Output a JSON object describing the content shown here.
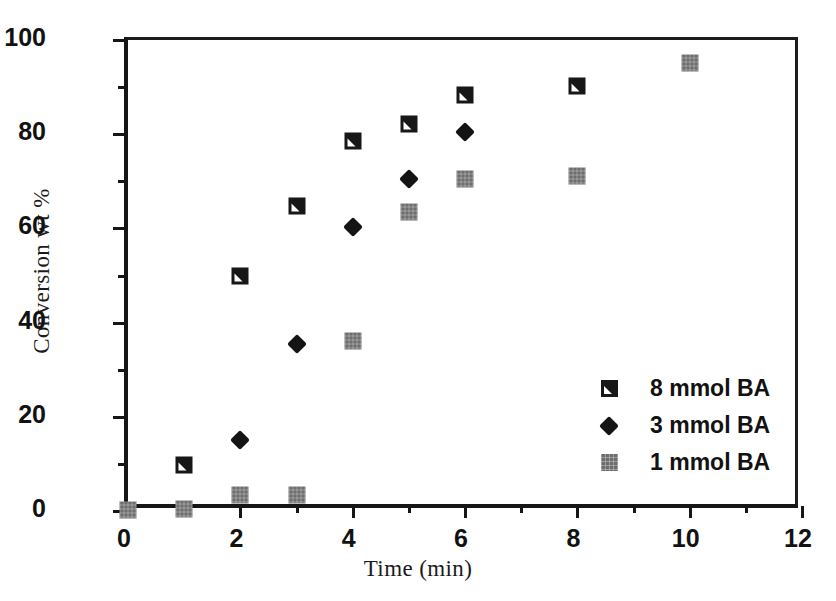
{
  "chart_data": {
    "type": "scatter",
    "title": "",
    "xlabel": "Time (min)",
    "ylabel": "Conversion wt %",
    "xlim": [
      0,
      12
    ],
    "ylim": [
      0,
      100
    ],
    "xticks": [
      0,
      2,
      4,
      6,
      8,
      10,
      12
    ],
    "xtick_labels": [
      "0",
      "2",
      "4",
      "6",
      "8",
      "10",
      "12"
    ],
    "xminor_ticks": [
      1,
      3,
      5,
      7,
      9,
      11
    ],
    "yticks": [
      0,
      20,
      40,
      60,
      80,
      100
    ],
    "ytick_labels": [
      "0",
      "20",
      "40",
      "60",
      "80",
      "100"
    ],
    "yminor_ticks": [
      10,
      30,
      50,
      70,
      90
    ],
    "grid": false,
    "legend_position": "center-right",
    "series": [
      {
        "name": "8 mmol BA",
        "marker": "square-notched",
        "color": "#171717",
        "x": [
          1,
          2,
          3,
          4,
          5,
          6,
          8
        ],
        "y": [
          9.8,
          49.8,
          64.7,
          78.6,
          82.2,
          88.3,
          90.3
        ]
      },
      {
        "name": "3 mmol BA",
        "marker": "diamond",
        "color": "#141414",
        "x": [
          2,
          3,
          4,
          5,
          6
        ],
        "y": [
          15.1,
          35.5,
          60.4,
          70.5,
          80.4
        ]
      },
      {
        "name": "1 mmol BA",
        "marker": "square-gray",
        "color": "#6d6d6d",
        "x": [
          0,
          1,
          2,
          3,
          4,
          5,
          6,
          8,
          10
        ],
        "y": [
          0.3,
          0.4,
          3.3,
          3.4,
          36.1,
          63.4,
          70.5,
          71.2,
          95.1
        ]
      }
    ]
  },
  "legend": {
    "entries": [
      {
        "label": "8 mmol BA",
        "marker": "square-notched"
      },
      {
        "label": "3 mmol BA",
        "marker": "diamond"
      },
      {
        "label": "1 mmol BA",
        "marker": "square-gray"
      }
    ]
  },
  "colors": {
    "axis": "#161616",
    "background": "#ffffff",
    "series_8mmol": "#171717",
    "series_3mmol": "#141414",
    "series_1mmol": "#6d6d6d"
  }
}
